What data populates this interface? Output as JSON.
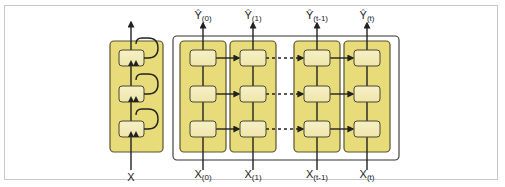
{
  "figure": {
    "folded": {
      "input_label": "X",
      "layers": 3
    },
    "unrolled": {
      "time_steps": [
        {
          "input": "X",
          "input_sub": "(0)",
          "output": "Ŷ",
          "output_sub": "(0)"
        },
        {
          "input": "X",
          "input_sub": "(1)",
          "output": "Ŷ",
          "output_sub": "(1)"
        },
        {
          "input": "X",
          "input_sub": "(t-1)",
          "output": "Ŷ",
          "output_sub": "(t-1)"
        },
        {
          "input": "X",
          "input_sub": "(t)",
          "output": "Ŷ",
          "output_sub": "(t)"
        }
      ],
      "layers": 3
    },
    "colors": {
      "column_fill": "#e8dc7a",
      "column_border": "#5a5330",
      "cell_fill": "#f3ecb9",
      "cell_border": "#4a4530",
      "arrow": "#222222",
      "frame": "#c8c8c8"
    }
  }
}
